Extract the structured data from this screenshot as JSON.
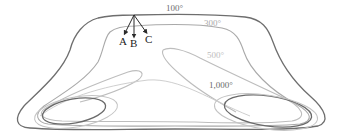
{
  "diagram": {
    "type": "isotherm contour diagram",
    "contours": [
      {
        "label": "100°",
        "color": "#6e6e6e"
      },
      {
        "label": "300°",
        "color": "#a9a9a9"
      },
      {
        "label": "500°",
        "color": "#bdbdbd"
      },
      {
        "label": "1,000°",
        "color": "#6a6a6a"
      }
    ],
    "arrows": [
      {
        "label": "A"
      },
      {
        "label": "B"
      },
      {
        "label": "C"
      }
    ],
    "colors": {
      "background": "#ffffff",
      "arrow": "#2a2a2a",
      "letter": "#222222"
    }
  }
}
